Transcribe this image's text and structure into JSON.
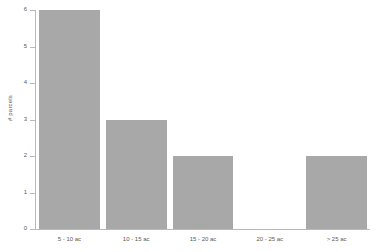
{
  "chart_data": {
    "type": "bar",
    "title": "",
    "subtitle": "",
    "xlabel": "",
    "ylabel": "# parcels",
    "categories": [
      "5 - 10 ac",
      "10 - 15 ac",
      "15 - 20 ac",
      "20 - 25 ac",
      "> 25 ac"
    ],
    "values": [
      6,
      3,
      2,
      0,
      2
    ],
    "ylim": [
      0,
      6
    ],
    "yticks": [
      0,
      1,
      2,
      3,
      4,
      5,
      6
    ],
    "ytick_labels": [
      "0",
      "1",
      "2",
      "3",
      "4",
      "5",
      "6"
    ],
    "grid": false,
    "legend": false,
    "legend_position": "none",
    "bar_color": "#a8a8a8",
    "axis_color": "#b9b9b9",
    "background_color": "#ffffff",
    "text_color": "#5a5a5a",
    "annotations": []
  }
}
